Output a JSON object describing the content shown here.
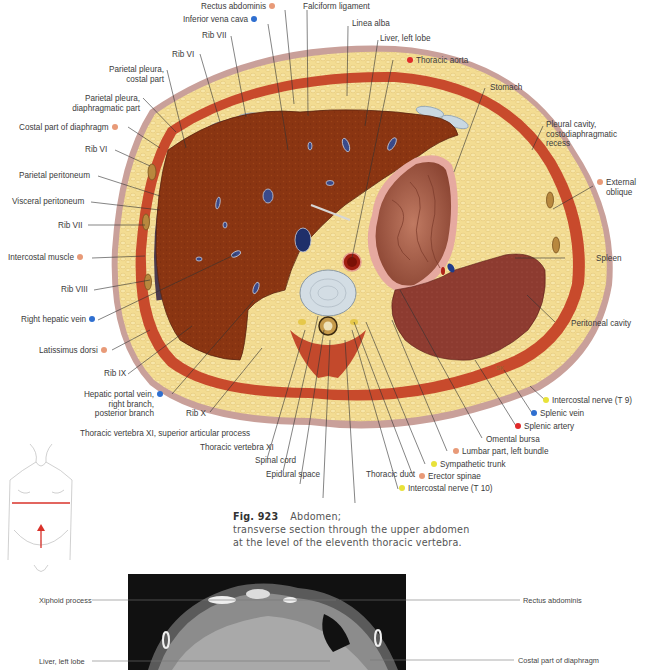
{
  "colors": {
    "muscle_dot": "#e89a78",
    "vein_dot": "#2f6fd0",
    "artery_dot": "#e02a2a",
    "nerve_dot": "#e8e23a",
    "liver": "#8a3512",
    "fat": "#f2d98c",
    "skin": "#b98a86",
    "spleen": "#8b3a30",
    "stomach": "#a86350",
    "section_line": "#d9322a"
  },
  "labels": {
    "rectus_abdominis": "Rectus abdominis",
    "inferior_vena_cava": "Inferior vena cava",
    "falciform_ligament": "Falciform ligament",
    "linea_alba": "Linea alba",
    "liver_left_lobe": "Liver, left lobe",
    "thoracic_aorta": "Thoracic aorta",
    "rib_vii_top": "Rib VII",
    "rib_vi_top": "Rib VI",
    "parietal_pleura_costal_1": "Parietal pleura,",
    "parietal_pleura_costal_2": "costal part",
    "parietal_pleura_diaph_1": "Parietal pleura,",
    "parietal_pleura_diaph_2": "diaphragmatic part",
    "costal_part_diaphragm": "Costal part of diaphragm",
    "stomach": "Stomach",
    "pleural_cavity_1": "Pleural cavity,",
    "pleural_cavity_2": "costodiaphragmatic",
    "pleural_cavity_3": "recess",
    "rib_vi_left": "Rib VI",
    "parietal_peritoneum": "Parietal peritoneum",
    "visceral_peritoneum": "Visceral peritoneum",
    "rib_vii_left": "Rib VII",
    "external_oblique_1": "External",
    "external_oblique_2": "oblique",
    "intercostal_muscle": "Intercostal muscle",
    "spleen": "Spleen",
    "rib_viii": "Rib VIII",
    "right_hepatic_vein": "Right hepatic vein",
    "peritoneal_cavity": "Peritoneal cavity",
    "latissimus_dorsi": "Latissimus dorsi",
    "rib_ix": "Rib IX",
    "intercostal_nerve_t9": "Intercostal nerve (T 9)",
    "splenic_vein": "Splenic vein",
    "splenic_artery": "Splenic artery",
    "hepatic_portal_1": "Hepatic portal vein,",
    "hepatic_portal_2": "right branch,",
    "hepatic_portal_3": "posterior branch",
    "rib_x": "Rib X",
    "omental_bursa": "Omental bursa",
    "lumbar_part": "Lumbar part, left bundle",
    "sympathetic_trunk": "Sympathetic trunk",
    "thoracic_vertebra_xi_sap": "Thoracic vertebra XI, superior articular process",
    "thoracic_vertebra_xi": "Thoracic vertebra XI",
    "erector_spinae": "Erector spinae",
    "spinal_cord": "Spinal cord",
    "intercostal_nerve_t10": "Intercostal nerve (T 10)",
    "epidural_space": "Epidural space",
    "thoracic_duct": "Thoracic duct",
    "artist_initials": "SK"
  },
  "caption": {
    "figure_number": "Fig. 923",
    "title": "Abdomen;",
    "line2": "transverse section through the upper abdomen",
    "line3": "at the level of the eleventh thoracic vertebra."
  },
  "ct": {
    "xiphoid_process": "Xiphoid process",
    "rectus_abdominis": "Rectus abdominis",
    "liver_left_lobe": "Liver, left lobe",
    "costal_part_diaphragm": "Costal part of diaphragm"
  }
}
